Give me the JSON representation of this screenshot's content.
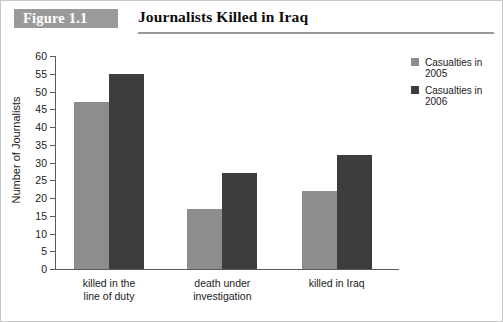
{
  "header": {
    "figure_badge": "Figure 1.1",
    "title": "Journalists Killed in Iraq"
  },
  "legend": {
    "items": [
      {
        "label_line1": "Casualties in",
        "label_line2": "2005",
        "color": "#8d8d8d",
        "swatch_name": "legend-swatch-2005"
      },
      {
        "label_line1": "Casualties in",
        "label_line2": "2006",
        "color": "#3d3d3d",
        "swatch_name": "legend-swatch-2006"
      }
    ]
  },
  "axis": {
    "y_title": "Number of Journalists",
    "y_ticks": [
      "0",
      "5",
      "10",
      "15",
      "20",
      "25",
      "30",
      "35",
      "40",
      "45",
      "50",
      "55",
      "60"
    ]
  },
  "categories_display": [
    {
      "line1": "killed in the",
      "line2": "line of duty"
    },
    {
      "line1": "death under",
      "line2": "investigation"
    },
    {
      "line1": "killed in Iraq",
      "line2": ""
    }
  ],
  "chart_data": {
    "type": "bar",
    "title": "Journalists Killed in Iraq",
    "subtitle": "Figure 1.1",
    "xlabel": "",
    "ylabel": "Number of Journalists",
    "ylim": [
      0,
      60
    ],
    "ytick_step": 5,
    "grid": false,
    "legend_position": "right",
    "categories": [
      "killed in the line of duty",
      "death under investigation",
      "killed in Iraq"
    ],
    "series": [
      {
        "name": "Casualties in 2005",
        "color": "#8d8d8d",
        "values": [
          47,
          17,
          22
        ]
      },
      {
        "name": "Casualties in 2006",
        "color": "#3d3d3d",
        "values": [
          55,
          27,
          32
        ]
      }
    ]
  }
}
